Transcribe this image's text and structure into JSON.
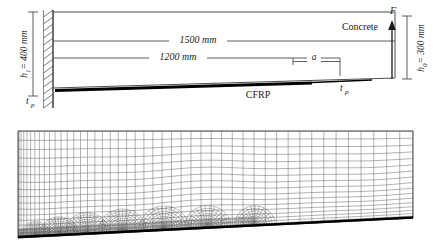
{
  "figure": {
    "kind": "fe-model-schematic",
    "panels": [
      {
        "id": "schematic",
        "name": "geometry-schematic"
      },
      {
        "id": "mesh",
        "name": "finite-element-mesh"
      }
    ]
  },
  "schematic": {
    "labels": {
      "height_left": "h₁ = 400 mm",
      "height_left_main": "h",
      "height_left_sub": "1",
      "height_left_rest": "= 400 mm",
      "height_right_main": "h",
      "height_right_sub": "0",
      "height_right_rest": "= 300 mm",
      "span_total": "1500 mm",
      "span_bond": "1200 mm",
      "crack_length": "a",
      "material_concrete": "Concrete",
      "material_cfrp": "CFRP",
      "thickness_left_main": "t",
      "thickness_left_sub": "p",
      "thickness_right_main": "t",
      "thickness_right_sub": "p",
      "force": "F"
    },
    "dimensions_mm": {
      "h1": 400,
      "h0": 300,
      "total_length": 1500,
      "bonded_length": 1200
    },
    "support": {
      "type": "fixed-hatched-wall"
    },
    "load": {
      "symbol": "F",
      "direction": "up",
      "location": "right-end"
    }
  },
  "mesh": {
    "description": "graded quadrilateral finite element mesh, refined toward lower-left crack region",
    "cfrp_strip": {
      "color": "#000000",
      "position": "bottom-sloping-edge"
    }
  },
  "colors": {
    "line": "#4d4d4d",
    "line_dark": "#333333",
    "cfrp": "#000000",
    "mesh_line": "#555555",
    "text": "#1a1a1a",
    "background": "#ffffff"
  }
}
